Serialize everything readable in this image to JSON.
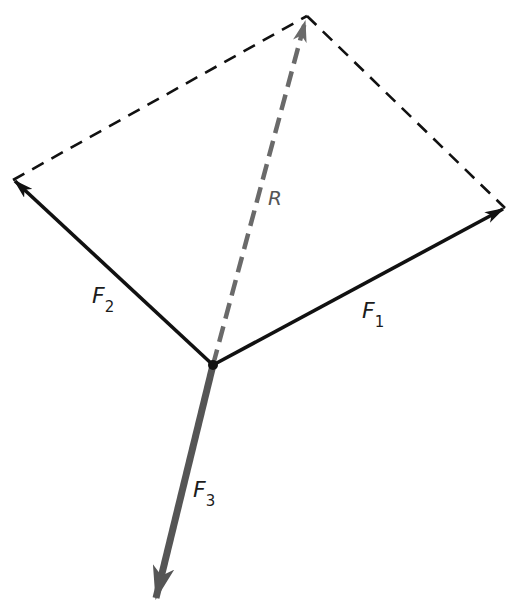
{
  "diagram": {
    "type": "force-vector-parallelogram",
    "origin": {
      "x": 213,
      "y": 365
    },
    "colors": {
      "force": "#111111",
      "resultant": "#6a6a6a",
      "f3": "#555555",
      "construction": "#111111",
      "background": "#ffffff"
    },
    "vectors": [
      {
        "id": "F1",
        "label": "F",
        "subscript": "1",
        "tip": {
          "x": 505,
          "y": 208
        },
        "style": "solid",
        "label_pos": {
          "x": 362,
          "y": 318
        }
      },
      {
        "id": "F2",
        "label": "F",
        "subscript": "2",
        "tip": {
          "x": 13,
          "y": 180
        },
        "style": "solid",
        "label_pos": {
          "x": 92,
          "y": 303
        }
      },
      {
        "id": "R",
        "label": "R",
        "subscript": "",
        "tip": {
          "x": 307,
          "y": 16
        },
        "style": "dashed",
        "label_pos": {
          "x": 268,
          "y": 205
        }
      },
      {
        "id": "F3",
        "label": "F",
        "subscript": "3",
        "tip": {
          "x": 154,
          "y": 605
        },
        "style": "solid-thick",
        "label_pos": {
          "x": 193,
          "y": 497
        }
      }
    ],
    "construction_lines": [
      {
        "from": {
          "x": 13,
          "y": 180
        },
        "to": {
          "x": 307,
          "y": 16
        }
      },
      {
        "from": {
          "x": 307,
          "y": 16
        },
        "to": {
          "x": 505,
          "y": 208
        }
      }
    ]
  }
}
